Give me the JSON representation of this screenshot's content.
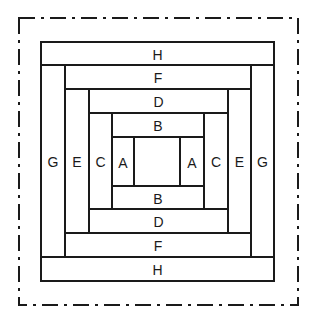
{
  "diagram": {
    "stroke_color": "#1a1a1a",
    "border_style": "dash-dot",
    "strips": [
      {
        "id": "H-top",
        "label": "H",
        "x": 41,
        "y": 42,
        "w": 233,
        "h": 23
      },
      {
        "id": "H-bottom",
        "label": "H",
        "x": 41,
        "y": 257,
        "w": 233,
        "h": 24
      },
      {
        "id": "G-left",
        "label": "G",
        "x": 41,
        "y": 65,
        "w": 24,
        "h": 192
      },
      {
        "id": "G-right",
        "label": "G",
        "x": 251,
        "y": 65,
        "w": 23,
        "h": 192
      },
      {
        "id": "F-top",
        "label": "F",
        "x": 65,
        "y": 65,
        "w": 186,
        "h": 24
      },
      {
        "id": "F-bottom",
        "label": "F",
        "x": 65,
        "y": 233,
        "w": 186,
        "h": 24
      },
      {
        "id": "E-left",
        "label": "E",
        "x": 65,
        "y": 89,
        "w": 24,
        "h": 144
      },
      {
        "id": "E-right",
        "label": "E",
        "x": 228,
        "y": 89,
        "w": 23,
        "h": 144
      },
      {
        "id": "D-top",
        "label": "D",
        "x": 89,
        "y": 89,
        "w": 139,
        "h": 24
      },
      {
        "id": "D-bottom",
        "label": "D",
        "x": 89,
        "y": 209,
        "w": 139,
        "h": 24
      },
      {
        "id": "C-left",
        "label": "C",
        "x": 89,
        "y": 113,
        "w": 23,
        "h": 96
      },
      {
        "id": "C-right",
        "label": "C",
        "x": 204,
        "y": 113,
        "w": 24,
        "h": 96
      },
      {
        "id": "B-top",
        "label": "B",
        "x": 112,
        "y": 113,
        "w": 92,
        "h": 24
      },
      {
        "id": "B-bottom",
        "label": "B",
        "x": 112,
        "y": 186,
        "w": 92,
        "h": 23
      },
      {
        "id": "A-left",
        "label": "A",
        "x": 112,
        "y": 137,
        "w": 22,
        "h": 49
      },
      {
        "id": "A-right",
        "label": "A",
        "x": 180,
        "y": 137,
        "w": 24,
        "h": 49
      },
      {
        "id": "center",
        "label": "",
        "x": 134,
        "y": 137,
        "w": 46,
        "h": 49
      }
    ]
  }
}
